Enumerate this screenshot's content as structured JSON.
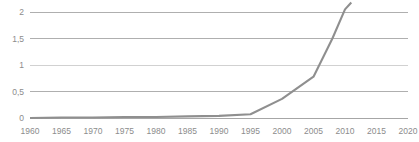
{
  "chart_data": {
    "type": "line",
    "title": "",
    "subtitle": "",
    "xlabel": "",
    "ylabel": "",
    "xlim": [
      1960,
      2020
    ],
    "ylim": [
      0,
      2
    ],
    "grid": true,
    "legend": false,
    "legend_position": "none",
    "decimal_separator": ",",
    "line_color": "#8f8f8f",
    "grid_color": "#a6a6a6",
    "tick_color": "#8c8c8c",
    "background_color": "#ffffff",
    "y_ticks": [
      0,
      0.5,
      1,
      1.5,
      2
    ],
    "y_tick_labels": [
      "0",
      "0,5",
      "1",
      "1,5",
      "2"
    ],
    "x_ticks": [
      1960,
      1965,
      1970,
      1975,
      1980,
      1985,
      1990,
      1995,
      2000,
      2005,
      2010,
      2015,
      2020
    ],
    "x_tick_labels": [
      "1960",
      "1965",
      "1970",
      "1975",
      "1980",
      "1985",
      "1990",
      "1995",
      "2000",
      "2005",
      "2010",
      "2015",
      "2020"
    ],
    "note": "series is clipped at the top of the plot area; final point exceeds the 2 gridline",
    "series": [
      {
        "name": "series-1",
        "x": [
          1960,
          1965,
          1970,
          1975,
          1980,
          1985,
          1990,
          1995,
          2000,
          2005,
          2008,
          2010,
          2011
        ],
        "values": [
          0.0,
          0.01,
          0.01,
          0.02,
          0.02,
          0.03,
          0.04,
          0.07,
          0.36,
          0.78,
          1.5,
          2.05,
          2.18
        ]
      }
    ]
  }
}
